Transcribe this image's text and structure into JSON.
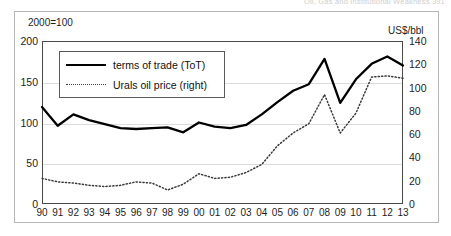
{
  "page": {
    "running_head": "Oil, Gas and Institutional Weakness      391"
  },
  "figure": {
    "left_unit_label": "2000=100",
    "right_unit_label": "US$/bbl"
  },
  "legend": {
    "position": "top-left-inside",
    "items": [
      {
        "label": "terms of trade (ToT)",
        "style": "solid",
        "color": "#000000"
      },
      {
        "label": "Urals oil price (right)",
        "style": "dotted",
        "color": "#3a3a3a"
      }
    ]
  },
  "chart_data": {
    "type": "line",
    "title": "",
    "subtitle": "",
    "xlabel": "",
    "ylabel": "2000=100",
    "y2label": "US$/bbl",
    "grid": true,
    "legend_position": "top-left-inside",
    "x": [
      "90",
      "91",
      "92",
      "93",
      "94",
      "95",
      "96",
      "97",
      "98",
      "99",
      "00",
      "01",
      "02",
      "03",
      "04",
      "05",
      "06",
      "07",
      "08",
      "09",
      "10",
      "11",
      "12",
      "13"
    ],
    "xtick_labels": [
      "90",
      "91",
      "92",
      "93",
      "94",
      "95",
      "96",
      "97",
      "98",
      "99",
      "00",
      "01",
      "02",
      "03",
      "04",
      "05",
      "06",
      "07",
      "08",
      "09",
      "10",
      "11",
      "12",
      "13"
    ],
    "ylim": [
      0,
      200
    ],
    "yticks": [
      0,
      50,
      100,
      150,
      200
    ],
    "y2lim": [
      0,
      140
    ],
    "y2ticks": [
      0,
      20,
      40,
      60,
      80,
      100,
      120,
      140
    ],
    "series": [
      {
        "name": "terms of trade (ToT)",
        "axis": "left",
        "style": "solid",
        "color": "#000000",
        "values": [
          119,
          96,
          110,
          103,
          98,
          93,
          92,
          93,
          94,
          88,
          100,
          95,
          93,
          97,
          110,
          125,
          139,
          147,
          178,
          124,
          153,
          172,
          181,
          170
        ]
      },
      {
        "name": "Urals oil price (right)",
        "axis": "right",
        "style": "dotted",
        "color": "#3a3a3a",
        "values": [
          22,
          19,
          18,
          16,
          15,
          16,
          19,
          18,
          12,
          17,
          26,
          22,
          23,
          27,
          34,
          50,
          61,
          69,
          94,
          61,
          78,
          109,
          110,
          108
        ]
      }
    ]
  }
}
